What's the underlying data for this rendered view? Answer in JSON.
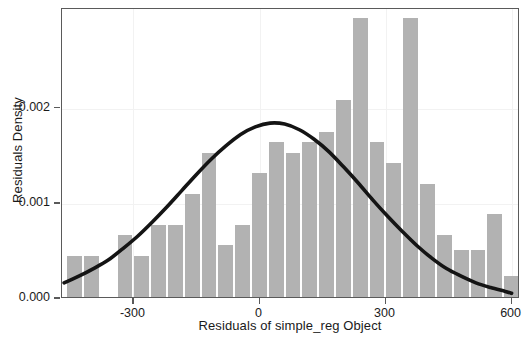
{
  "chart_data": {
    "type": "bar",
    "title": "",
    "xlabel": "Residuals of simple_reg Object",
    "ylabel": "Residuals Density",
    "xlim": [
      -470,
      620
    ],
    "ylim": [
      0,
      0.00305
    ],
    "grid": true,
    "legend": null,
    "xticks": [
      -300,
      0,
      300,
      600
    ],
    "xticklabels": [
      "-300",
      "0",
      "300",
      "600"
    ],
    "yticks": [
      0.0,
      0.001,
      0.002
    ],
    "yticklabels": [
      "0.000",
      "0.001",
      "0.002"
    ],
    "bar_color": "#b2b2b2",
    "curve_color": "#141414",
    "frame_color": "#5a5a5a",
    "bin_width": 40,
    "bins": [
      {
        "x0": -460,
        "x1": -420,
        "center": -440,
        "density": 0.00043
      },
      {
        "x0": -420,
        "x1": -380,
        "center": -400,
        "density": 0.00043
      },
      {
        "x0": -380,
        "x1": -340,
        "center": -360,
        "density": 0.0
      },
      {
        "x0": -340,
        "x1": -300,
        "center": -320,
        "density": 0.00065
      },
      {
        "x0": -300,
        "x1": -260,
        "center": -280,
        "density": 0.00043
      },
      {
        "x0": -260,
        "x1": -220,
        "center": -240,
        "density": 0.00076
      },
      {
        "x0": -220,
        "x1": -180,
        "center": -200,
        "density": 0.00076
      },
      {
        "x0": -180,
        "x1": -140,
        "center": -160,
        "density": 0.00108
      },
      {
        "x0": -140,
        "x1": -100,
        "center": -120,
        "density": 0.00152
      },
      {
        "x0": -100,
        "x1": -60,
        "center": -80,
        "density": 0.00055
      },
      {
        "x0": -60,
        "x1": -20,
        "center": -40,
        "density": 0.00076
      },
      {
        "x0": -20,
        "x1": 20,
        "center": 0,
        "density": 0.0013
      },
      {
        "x0": 20,
        "x1": 60,
        "center": 40,
        "density": 0.00163
      },
      {
        "x0": 60,
        "x1": 100,
        "center": 80,
        "density": 0.00152
      },
      {
        "x0": 100,
        "x1": 140,
        "center": 120,
        "density": 0.00163
      },
      {
        "x0": 140,
        "x1": 180,
        "center": 160,
        "density": 0.00174
      },
      {
        "x0": 180,
        "x1": 220,
        "center": 200,
        "density": 0.00207
      },
      {
        "x0": 220,
        "x1": 260,
        "center": 240,
        "density": 0.00293
      },
      {
        "x0": 260,
        "x1": 300,
        "center": 280,
        "density": 0.00163
      },
      {
        "x0": 300,
        "x1": 340,
        "center": 320,
        "density": 0.00141
      },
      {
        "x0": 340,
        "x1": 380,
        "center": 360,
        "density": 0.00293
      },
      {
        "x0": 380,
        "x1": 420,
        "center": 400,
        "density": 0.00119
      },
      {
        "x0": 420,
        "x1": 460,
        "center": 440,
        "density": 0.00065
      },
      {
        "x0": 460,
        "x1": 500,
        "center": 480,
        "density": 0.00049
      },
      {
        "x0": 500,
        "x1": 540,
        "center": 520,
        "density": 0.00049
      },
      {
        "x0": 540,
        "x1": 580,
        "center": 560,
        "density": 0.00087
      },
      {
        "x0": 580,
        "x1": 620,
        "center": 600,
        "density": 0.00022
      },
      {
        "x0": 620,
        "x1": 660,
        "center": 640,
        "density": 0.00022
      },
      {
        "x0": 660,
        "x1": 700,
        "center": 680,
        "density": 0.00065
      },
      {
        "x0": 700,
        "x1": 740,
        "center": 720,
        "density": 0.00033
      },
      {
        "x0": 740,
        "x1": 780,
        "center": 760,
        "density": 0.0
      },
      {
        "x0": 780,
        "x1": 820,
        "center": 800,
        "density": 0.00033
      },
      {
        "x0": 820,
        "x1": 860,
        "center": 840,
        "density": 0.00033
      }
    ],
    "normal_curve": {
      "label": "normal density overlay",
      "mean": 5,
      "sd": 215,
      "peak_density": 0.00185,
      "points": [
        {
          "x": -465,
          "y": 0.00017
        },
        {
          "x": -430,
          "y": 0.00024
        },
        {
          "x": -395,
          "y": 0.00032
        },
        {
          "x": -360,
          "y": 0.00041
        },
        {
          "x": -325,
          "y": 0.00053
        },
        {
          "x": -290,
          "y": 0.00066
        },
        {
          "x": -255,
          "y": 0.00081
        },
        {
          "x": -220,
          "y": 0.00097
        },
        {
          "x": -185,
          "y": 0.00114
        },
        {
          "x": -150,
          "y": 0.00131
        },
        {
          "x": -115,
          "y": 0.00147
        },
        {
          "x": -80,
          "y": 0.00161
        },
        {
          "x": -45,
          "y": 0.00173
        },
        {
          "x": -10,
          "y": 0.00181
        },
        {
          "x": 25,
          "y": 0.00185
        },
        {
          "x": 60,
          "y": 0.00184
        },
        {
          "x": 95,
          "y": 0.00178
        },
        {
          "x": 130,
          "y": 0.00168
        },
        {
          "x": 165,
          "y": 0.00155
        },
        {
          "x": 200,
          "y": 0.00139
        },
        {
          "x": 235,
          "y": 0.00122
        },
        {
          "x": 270,
          "y": 0.00104
        },
        {
          "x": 305,
          "y": 0.00087
        },
        {
          "x": 340,
          "y": 0.00071
        },
        {
          "x": 375,
          "y": 0.00056
        },
        {
          "x": 410,
          "y": 0.00043
        },
        {
          "x": 445,
          "y": 0.00032
        },
        {
          "x": 480,
          "y": 0.00024
        },
        {
          "x": 515,
          "y": 0.00017
        },
        {
          "x": 550,
          "y": 0.00012
        },
        {
          "x": 585,
          "y": 8e-05
        },
        {
          "x": 600,
          "y": 6e-05
        }
      ]
    }
  }
}
